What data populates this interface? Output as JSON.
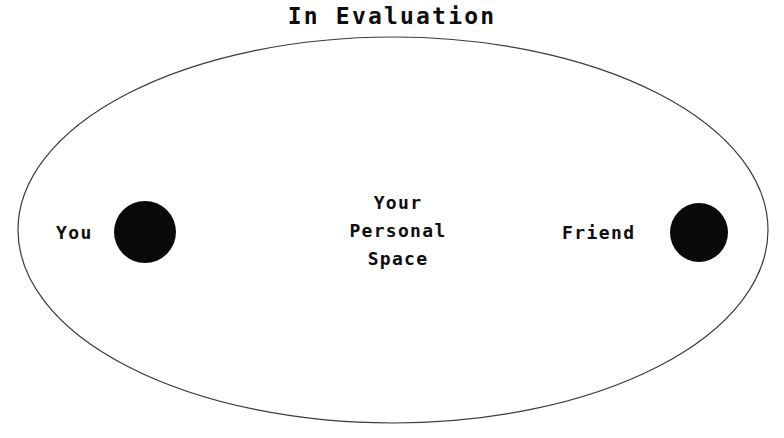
{
  "diagram": {
    "title": "In Evaluation",
    "background_color": "#ffffff",
    "boundary": {
      "name": "personal-space-ellipse",
      "stroke_color": "#3a3a3a",
      "fill_color": "#ffffff",
      "stroke_width": 1.2,
      "center_x": 393,
      "center_y": 230,
      "radius_x": 375,
      "radius_y": 193
    },
    "actors": [
      {
        "label": "You",
        "marker_color": "#0a0a0a",
        "marker_shape": "filled-circle",
        "center_x": 145,
        "center_y": 232,
        "diameter": 62
      },
      {
        "label": "Friend",
        "marker_color": "#0a0a0a",
        "marker_shape": "filled-circle",
        "center_x": 699,
        "center_y": 232,
        "diameter": 58
      }
    ],
    "center_note": {
      "line1": "Your",
      "line2": "Personal",
      "line3": "Space"
    }
  }
}
